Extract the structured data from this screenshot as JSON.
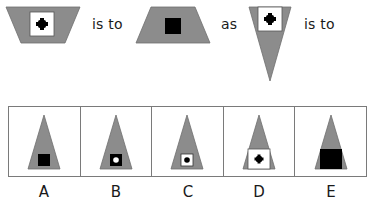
{
  "puzzle": {
    "type": "visual-analogy",
    "words": {
      "is_to_1": "is to",
      "as": "as",
      "is_to_2": "is to"
    },
    "colors": {
      "shape_fill": "#8c8c8c",
      "inner_white": "#ffffff",
      "inner_black": "#000000",
      "border": "#7a7a7a"
    },
    "stimulus": [
      {
        "id": "figure-1",
        "shape": "inverted-trapezoid",
        "inner": "white square with black cross-dot"
      },
      {
        "id": "figure-2",
        "shape": "upright-trapezoid",
        "inner": "black square"
      },
      {
        "id": "figure-3",
        "shape": "inverted-triangle",
        "inner": "white square with black cross-dot"
      }
    ],
    "options": [
      {
        "label": "A",
        "description": "upright triangle with small black square"
      },
      {
        "label": "B",
        "description": "upright triangle with black square containing white dot"
      },
      {
        "label": "C",
        "description": "upright triangle with white square containing black dot"
      },
      {
        "label": "D",
        "description": "upright triangle with large white square containing black cross-dot"
      },
      {
        "label": "E",
        "description": "upright triangle with large black square"
      }
    ]
  }
}
